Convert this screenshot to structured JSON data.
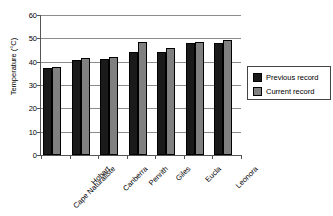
{
  "chart_data": {
    "type": "bar",
    "title": "Heatwave",
    "categories": [
      "Cape Naturaliste",
      "Hobart",
      "Canberra",
      "Penrith",
      "Giles",
      "Eucla",
      "Leonora"
    ],
    "series": [
      {
        "name": "Previous record",
        "color": "#1a1a1a",
        "values": [
          37.5,
          40.6,
          41.2,
          44.1,
          44.3,
          47.8,
          48.0
        ]
      },
      {
        "name": "Current record",
        "color": "#808080",
        "values": [
          37.8,
          41.7,
          42.0,
          48.6,
          45.8,
          48.3,
          49.2
        ]
      }
    ],
    "xlabel": "",
    "ylabel": "Temperature (°C)",
    "ylim": [
      0,
      60
    ],
    "ytick_values": [
      0,
      10,
      20,
      30,
      40,
      50,
      60
    ],
    "ytick_labels": [
      "0",
      "10",
      "20",
      "30",
      "40",
      "50",
      "60"
    ],
    "grid": true,
    "legend_position": "right"
  },
  "legend": {
    "items": [
      {
        "label": "Previous record",
        "color": "#1a1a1a"
      },
      {
        "label": "Current record",
        "color": "#808080"
      }
    ]
  }
}
